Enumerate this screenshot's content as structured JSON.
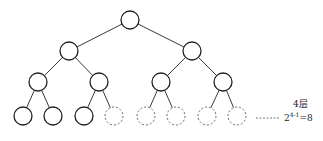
{
  "diagram": {
    "type": "complete-binary-tree",
    "levels": 4,
    "node_radius": 9,
    "stroke_color": "#222222",
    "dashed_color": "#666666",
    "nodes": [
      {
        "id": "n1",
        "x": 130,
        "y": 20,
        "style": "solid"
      },
      {
        "id": "n2",
        "x": 69,
        "y": 51,
        "style": "solid"
      },
      {
        "id": "n3",
        "x": 192,
        "y": 51,
        "style": "solid"
      },
      {
        "id": "n4",
        "x": 38,
        "y": 82,
        "style": "solid"
      },
      {
        "id": "n5",
        "x": 99,
        "y": 82,
        "style": "solid"
      },
      {
        "id": "n6",
        "x": 161,
        "y": 82,
        "style": "solid"
      },
      {
        "id": "n7",
        "x": 223,
        "y": 82,
        "style": "solid"
      },
      {
        "id": "n8",
        "x": 23,
        "y": 116,
        "style": "solid"
      },
      {
        "id": "n9",
        "x": 53,
        "y": 116,
        "style": "solid"
      },
      {
        "id": "n10",
        "x": 84,
        "y": 116,
        "style": "solid"
      },
      {
        "id": "n11",
        "x": 114,
        "y": 116,
        "style": "dashed"
      },
      {
        "id": "n12",
        "x": 146,
        "y": 116,
        "style": "dashed"
      },
      {
        "id": "n13",
        "x": 176,
        "y": 116,
        "style": "dashed"
      },
      {
        "id": "n14",
        "x": 207,
        "y": 116,
        "style": "dashed"
      },
      {
        "id": "n15",
        "x": 237,
        "y": 116,
        "style": "dashed"
      }
    ],
    "edges": [
      [
        "n1",
        "n2"
      ],
      [
        "n1",
        "n3"
      ],
      [
        "n2",
        "n4"
      ],
      [
        "n2",
        "n5"
      ],
      [
        "n3",
        "n6"
      ],
      [
        "n3",
        "n7"
      ],
      [
        "n4",
        "n8"
      ],
      [
        "n4",
        "n9"
      ],
      [
        "n5",
        "n10"
      ],
      [
        "n5",
        "n11"
      ],
      [
        "n6",
        "n12"
      ],
      [
        "n6",
        "n13"
      ],
      [
        "n7",
        "n14"
      ],
      [
        "n7",
        "n15"
      ]
    ],
    "leader_line": {
      "x1": 256,
      "x2": 279,
      "y": 118
    },
    "annotation": {
      "level_label": "4层",
      "formula_base": "2",
      "formula_exponent": "4-1",
      "formula_result": "=8"
    }
  }
}
